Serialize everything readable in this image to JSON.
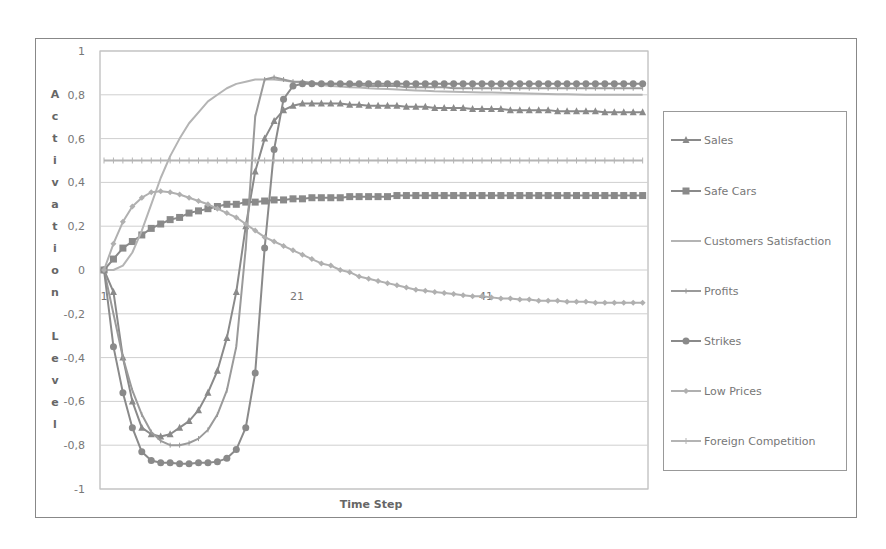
{
  "chart_data": {
    "type": "line",
    "title": "",
    "xlabel": "Time Step",
    "ylabel": "Activation Level",
    "ylim": [
      -1,
      1
    ],
    "yticks": [
      "1",
      "0,8",
      "0,6",
      "0,4",
      "0,2",
      "0",
      "-0,2",
      "-0,4",
      "-0,6",
      "-0,8",
      "-1"
    ],
    "xtick_labels": [
      "1",
      "21",
      "41"
    ],
    "grid": true,
    "legend_position": "right",
    "x": [
      1,
      2,
      3,
      4,
      5,
      6,
      7,
      8,
      9,
      10,
      11,
      12,
      13,
      14,
      15,
      16,
      17,
      18,
      19,
      20,
      21,
      22,
      23,
      24,
      25,
      26,
      27,
      28,
      29,
      30,
      31,
      32,
      33,
      34,
      35,
      36,
      37,
      38,
      39,
      40,
      41,
      42,
      43,
      44,
      45,
      46,
      47,
      48,
      49,
      50,
      51,
      52,
      53,
      54,
      55,
      56,
      57,
      58
    ],
    "series": [
      {
        "name": "Sales",
        "marker": "triangle",
        "color": "#8a8a8a",
        "values": [
          0,
          -0.1,
          -0.4,
          -0.6,
          -0.72,
          -0.75,
          -0.76,
          -0.75,
          -0.72,
          -0.69,
          -0.64,
          -0.56,
          -0.46,
          -0.31,
          -0.1,
          0.2,
          0.45,
          0.6,
          0.68,
          0.73,
          0.75,
          0.76,
          0.76,
          0.76,
          0.76,
          0.76,
          0.755,
          0.755,
          0.75,
          0.75,
          0.75,
          0.75,
          0.745,
          0.745,
          0.745,
          0.74,
          0.74,
          0.74,
          0.74,
          0.735,
          0.735,
          0.735,
          0.735,
          0.73,
          0.73,
          0.73,
          0.73,
          0.73,
          0.725,
          0.725,
          0.725,
          0.725,
          0.725,
          0.72,
          0.72,
          0.72,
          0.72,
          0.72
        ]
      },
      {
        "name": "Safe Cars",
        "marker": "square",
        "color": "#8a8a8a",
        "values": [
          0,
          0.05,
          0.1,
          0.13,
          0.16,
          0.19,
          0.21,
          0.23,
          0.24,
          0.26,
          0.27,
          0.28,
          0.29,
          0.3,
          0.3,
          0.31,
          0.31,
          0.315,
          0.32,
          0.32,
          0.325,
          0.325,
          0.33,
          0.33,
          0.33,
          0.33,
          0.335,
          0.335,
          0.335,
          0.335,
          0.335,
          0.34,
          0.34,
          0.34,
          0.34,
          0.34,
          0.34,
          0.34,
          0.34,
          0.34,
          0.34,
          0.34,
          0.34,
          0.34,
          0.34,
          0.34,
          0.34,
          0.34,
          0.34,
          0.34,
          0.34,
          0.34,
          0.34,
          0.34,
          0.34,
          0.34,
          0.34,
          0.34
        ]
      },
      {
        "name": "Customers Satisfaction",
        "marker": "none",
        "color": "#b4b4b4",
        "values": [
          0,
          0,
          0.02,
          0.08,
          0.18,
          0.3,
          0.42,
          0.52,
          0.6,
          0.67,
          0.72,
          0.77,
          0.8,
          0.83,
          0.85,
          0.86,
          0.87,
          0.87,
          0.87,
          0.865,
          0.86,
          0.855,
          0.85,
          0.845,
          0.84,
          0.838,
          0.835,
          0.833,
          0.83,
          0.828,
          0.826,
          0.824,
          0.822,
          0.82,
          0.818,
          0.816,
          0.815,
          0.814,
          0.813,
          0.812,
          0.811,
          0.81,
          0.809,
          0.808,
          0.807,
          0.806,
          0.805,
          0.804,
          0.803,
          0.802,
          0.801,
          0.8,
          0.8,
          0.8,
          0.8,
          0.8,
          0.8,
          0.8
        ]
      },
      {
        "name": "Profits",
        "marker": "cross",
        "color": "#9a9a9a",
        "values": [
          0,
          -0.2,
          -0.4,
          -0.55,
          -0.66,
          -0.74,
          -0.78,
          -0.8,
          -0.8,
          -0.79,
          -0.77,
          -0.73,
          -0.66,
          -0.55,
          -0.35,
          0.1,
          0.7,
          0.87,
          0.88,
          0.87,
          0.86,
          0.86,
          0.855,
          0.85,
          0.85,
          0.85,
          0.845,
          0.845,
          0.84,
          0.84,
          0.84,
          0.84,
          0.835,
          0.835,
          0.835,
          0.835,
          0.835,
          0.83,
          0.83,
          0.83,
          0.83,
          0.83,
          0.83,
          0.83,
          0.83,
          0.83,
          0.83,
          0.83,
          0.83,
          0.83,
          0.83,
          0.83,
          0.83,
          0.83,
          0.83,
          0.83,
          0.83,
          0.83
        ]
      },
      {
        "name": "Strikes",
        "marker": "circle",
        "color": "#8a8a8a",
        "values": [
          0,
          -0.35,
          -0.56,
          -0.72,
          -0.83,
          -0.87,
          -0.88,
          -0.88,
          -0.885,
          -0.885,
          -0.88,
          -0.88,
          -0.875,
          -0.86,
          -0.82,
          -0.72,
          -0.47,
          0.1,
          0.55,
          0.78,
          0.84,
          0.85,
          0.85,
          0.85,
          0.85,
          0.85,
          0.85,
          0.85,
          0.85,
          0.85,
          0.85,
          0.85,
          0.85,
          0.85,
          0.85,
          0.85,
          0.85,
          0.85,
          0.85,
          0.85,
          0.85,
          0.85,
          0.85,
          0.85,
          0.85,
          0.85,
          0.85,
          0.85,
          0.85,
          0.85,
          0.85,
          0.85,
          0.85,
          0.85,
          0.85,
          0.85,
          0.85,
          0.85
        ]
      },
      {
        "name": "Low Prices",
        "marker": "diamond",
        "color": "#b0b0b0",
        "values": [
          0,
          0.12,
          0.22,
          0.29,
          0.33,
          0.355,
          0.36,
          0.355,
          0.345,
          0.33,
          0.315,
          0.3,
          0.28,
          0.26,
          0.24,
          0.21,
          0.18,
          0.15,
          0.13,
          0.11,
          0.09,
          0.07,
          0.05,
          0.03,
          0.02,
          0.0,
          -0.01,
          -0.03,
          -0.04,
          -0.05,
          -0.06,
          -0.07,
          -0.08,
          -0.09,
          -0.095,
          -0.1,
          -0.105,
          -0.11,
          -0.115,
          -0.12,
          -0.12,
          -0.125,
          -0.13,
          -0.13,
          -0.135,
          -0.135,
          -0.14,
          -0.14,
          -0.14,
          -0.145,
          -0.145,
          -0.145,
          -0.15,
          -0.15,
          -0.15,
          -0.15,
          -0.15,
          -0.15
        ]
      },
      {
        "name": "Foreign Competition",
        "marker": "tick",
        "color": "#b4b4b4",
        "values": [
          0.5,
          0.5,
          0.5,
          0.5,
          0.5,
          0.5,
          0.5,
          0.5,
          0.5,
          0.5,
          0.5,
          0.5,
          0.5,
          0.5,
          0.5,
          0.5,
          0.5,
          0.5,
          0.5,
          0.5,
          0.5,
          0.5,
          0.5,
          0.5,
          0.5,
          0.5,
          0.5,
          0.5,
          0.5,
          0.5,
          0.5,
          0.5,
          0.5,
          0.5,
          0.5,
          0.5,
          0.5,
          0.5,
          0.5,
          0.5,
          0.5,
          0.5,
          0.5,
          0.5,
          0.5,
          0.5,
          0.5,
          0.5,
          0.5,
          0.5,
          0.5,
          0.5,
          0.5,
          0.5,
          0.5,
          0.5,
          0.5,
          0.5
        ]
      }
    ]
  },
  "legend": {
    "items": [
      "Sales",
      "Safe Cars",
      "Customers Satisfaction",
      "Profits",
      "Strikes",
      "Low Prices",
      "Foreign Competition"
    ]
  }
}
